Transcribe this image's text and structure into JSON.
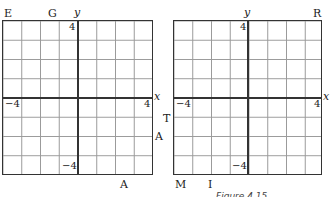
{
  "figure": {
    "caption": "Figure 4.15",
    "left_grid": {
      "axis_x_label": "x",
      "axis_y_label": "y",
      "tick_top": "4",
      "tick_left": "−4",
      "tick_right": "4",
      "tick_bottom": "−4",
      "range": [
        -4,
        4
      ]
    },
    "right_grid": {
      "axis_x_label": "x",
      "axis_y_label": "y",
      "tick_top": "4",
      "tick_left": "−4",
      "tick_right": "4",
      "tick_bottom": "−4",
      "range": [
        -4,
        4
      ]
    },
    "letters": {
      "E": "E",
      "G": "G",
      "R": "R",
      "T": "T",
      "A_mid": "A",
      "A_bottom": "A",
      "M": "M",
      "I": "I"
    }
  }
}
